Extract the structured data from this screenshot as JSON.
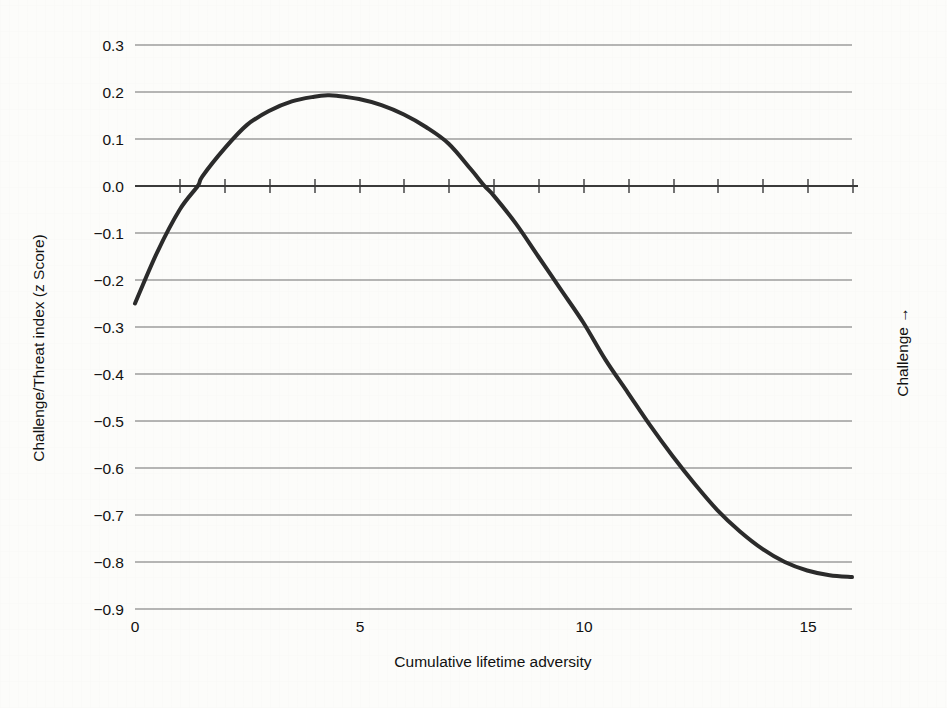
{
  "chart_data": {
    "type": "line",
    "title": "",
    "xlabel": "Cumulative lifetime adversity",
    "ylabel": "Challenge/Threat index (z Score)",
    "right_axis_label": "Challenge →",
    "xlim": [
      0,
      16
    ],
    "ylim": [
      -0.9,
      0.3
    ],
    "grid": true,
    "legend": "none",
    "x_tick_labels": [
      "0",
      "5",
      "10",
      "15"
    ],
    "x_tick_values": [
      0,
      5,
      10,
      15
    ],
    "x_minor_tick_interval": 1,
    "y_tick_labels": [
      "0.3",
      "0.2",
      "0.1",
      "0.0",
      "−0.1",
      "−0.2",
      "−0.3",
      "−0.4",
      "−0.5",
      "−0.6",
      "−0.7",
      "−0.8",
      "−0.9"
    ],
    "y_tick_values": [
      0.3,
      0.2,
      0.1,
      0.0,
      -0.1,
      -0.2,
      -0.3,
      -0.4,
      -0.5,
      -0.6,
      -0.7,
      -0.8,
      -0.9
    ],
    "series": [
      {
        "name": "Challenge/Threat index",
        "color": "#2b2b2b",
        "line_width": 4,
        "x": [
          0,
          0.5,
          1,
          1.4,
          1.5,
          2,
          2.5,
          3,
          3.5,
          4,
          4.3,
          4.5,
          5,
          5.5,
          6,
          6.5,
          7,
          7.5,
          7.8,
          8,
          8.5,
          9,
          9.5,
          10,
          10.5,
          11,
          11.5,
          12,
          12.5,
          13,
          13.5,
          14,
          14.5,
          15,
          15.5,
          16
        ],
        "y": [
          -0.25,
          -0.14,
          -0.05,
          0.0,
          0.02,
          0.08,
          0.13,
          0.16,
          0.18,
          0.19,
          0.193,
          0.192,
          0.185,
          0.172,
          0.152,
          0.125,
          0.09,
          0.035,
          0.0,
          -0.02,
          -0.08,
          -0.15,
          -0.22,
          -0.29,
          -0.37,
          -0.44,
          -0.51,
          -0.575,
          -0.635,
          -0.69,
          -0.735,
          -0.772,
          -0.8,
          -0.818,
          -0.828,
          -0.832
        ]
      }
    ],
    "annotations": {
      "peak_x": 4.3,
      "peak_y": 0.19,
      "zero_crossings": [
        1.4,
        7.8
      ],
      "start_y": -0.25,
      "end_y": -0.83
    },
    "colors": {
      "curve": "#2b2b2b",
      "gridline": "#6e6e6e",
      "zero_axis": "#3a3a3a",
      "text": "#111111",
      "background": "#fcfcfa"
    }
  }
}
